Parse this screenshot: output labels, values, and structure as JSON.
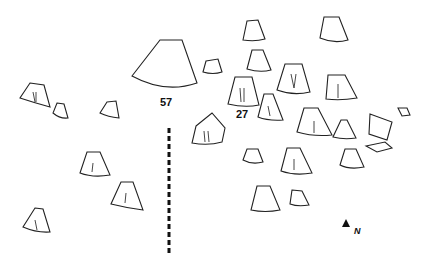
{
  "labels": {
    "feature_57": "57",
    "feature_27": "27",
    "north": "N"
  },
  "colors": {
    "line": "#222222",
    "background": "#ffffff"
  },
  "features": [
    {
      "id": "57",
      "cx": 165,
      "cy": 70,
      "w": 70,
      "h": 40
    },
    {
      "id": "27",
      "cx": 243,
      "cy": 92,
      "w": 30,
      "h": 30
    }
  ],
  "divider": {
    "x": 169,
    "y1": 128,
    "y2": 255,
    "style": "dashed"
  },
  "north_arrow": {
    "x": 346,
    "y": 222,
    "label": "N"
  }
}
